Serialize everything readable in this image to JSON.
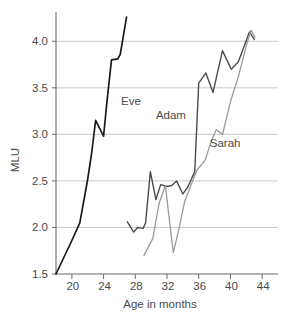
{
  "chart_data": {
    "type": "line",
    "title": "",
    "xlabel": "Age in months",
    "ylabel": "MLU",
    "xlim": [
      18,
      46
    ],
    "ylim": [
      1.5,
      4.25
    ],
    "xticks": [
      20,
      24,
      28,
      32,
      36,
      40,
      44
    ],
    "yticks": [
      1.5,
      2.0,
      2.5,
      3.0,
      3.5,
      4.0
    ],
    "xtick_labels": [
      "20",
      "24",
      "28",
      "32",
      "36",
      "40",
      "44"
    ],
    "ytick_labels": [
      "1.5",
      "2.0",
      "2.5",
      "3.0",
      "3.5",
      "4.0"
    ],
    "grid": "horizontal",
    "legend_position": "inline-annotations",
    "series": [
      {
        "name": "Eve",
        "color": "#1a1a1a",
        "width": 1.7,
        "label_x": 26.2,
        "label_y": 3.32,
        "points": [
          [
            18.0,
            1.5
          ],
          [
            19.0,
            1.68
          ],
          [
            20.0,
            1.86
          ],
          [
            21.0,
            2.05
          ],
          [
            21.6,
            2.33
          ],
          [
            22.0,
            2.52
          ],
          [
            22.5,
            2.8
          ],
          [
            23.0,
            3.15
          ],
          [
            24.0,
            2.98
          ],
          [
            24.4,
            3.33
          ],
          [
            25.0,
            3.8
          ],
          [
            25.8,
            3.81
          ],
          [
            26.1,
            3.86
          ],
          [
            26.9,
            4.26
          ]
        ]
      },
      {
        "name": "Adam",
        "color": "#4c4c4c",
        "width": 1.4,
        "label_x": 30.6,
        "label_y": 3.17,
        "points": [
          [
            27.0,
            2.06
          ],
          [
            27.8,
            1.95
          ],
          [
            28.3,
            2.0
          ],
          [
            29.0,
            1.99
          ],
          [
            29.3,
            2.05
          ],
          [
            29.9,
            2.6
          ],
          [
            30.6,
            2.3
          ],
          [
            31.2,
            2.46
          ],
          [
            32.0,
            2.44
          ],
          [
            32.6,
            2.45
          ],
          [
            33.2,
            2.5
          ],
          [
            34.0,
            2.36
          ],
          [
            34.6,
            2.43
          ],
          [
            35.5,
            2.6
          ],
          [
            36.0,
            3.55
          ],
          [
            36.9,
            3.66
          ],
          [
            37.8,
            3.45
          ],
          [
            39.0,
            3.9
          ],
          [
            40.1,
            3.7
          ],
          [
            41.0,
            3.78
          ],
          [
            42.4,
            4.1
          ],
          [
            43.0,
            4.02
          ]
        ]
      },
      {
        "name": "Sarah",
        "color": "#9a9a9a",
        "width": 1.3,
        "label_x": 37.4,
        "label_y": 2.86,
        "points": [
          [
            29.1,
            1.7
          ],
          [
            30.2,
            1.88
          ],
          [
            31.0,
            2.26
          ],
          [
            31.8,
            2.45
          ],
          [
            32.3,
            2.08
          ],
          [
            32.8,
            1.73
          ],
          [
            33.6,
            2.02
          ],
          [
            34.2,
            2.27
          ],
          [
            35.0,
            2.45
          ],
          [
            35.8,
            2.62
          ],
          [
            36.8,
            2.72
          ],
          [
            37.6,
            2.93
          ],
          [
            38.2,
            3.05
          ],
          [
            39.0,
            3.0
          ],
          [
            40.0,
            3.35
          ],
          [
            41.0,
            3.62
          ],
          [
            42.0,
            3.95
          ],
          [
            42.6,
            4.12
          ],
          [
            43.1,
            4.04
          ]
        ]
      }
    ]
  }
}
